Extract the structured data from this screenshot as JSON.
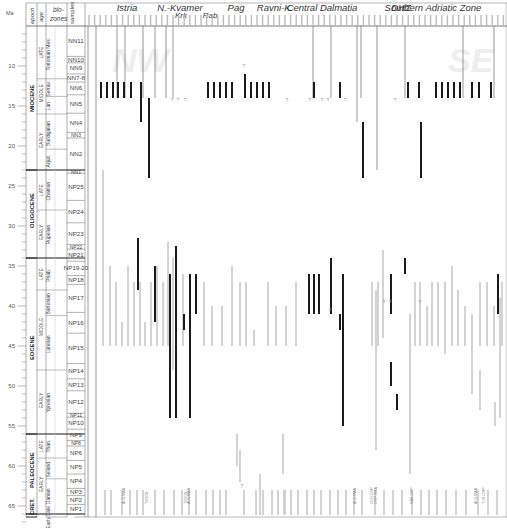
{
  "chart_data": {
    "type": "range_chart",
    "title": "",
    "ylabel": "Ma",
    "ylim": [
      5,
      68
    ],
    "y_ticks": [
      10,
      15,
      20,
      25,
      30,
      35,
      40,
      45,
      50,
      55,
      60,
      65
    ],
    "header": {
      "epoch": "epoch",
      "age": "age",
      "biozones": "bio-zones",
      "samples": "samples"
    },
    "regions": [
      {
        "name": "Istria",
        "x": 127
      },
      {
        "name": "N.-Kvamer",
        "x": 180
      },
      {
        "name": "Krk",
        "x": 181,
        "sub": true
      },
      {
        "name": "Rab",
        "x": 210,
        "sub": true
      },
      {
        "name": "Pag",
        "x": 236
      },
      {
        "name": "Ravni-K.",
        "x": 275
      },
      {
        "name": "Central Dalmatia",
        "x": 322
      },
      {
        "name": "DHZ",
        "x": 401
      },
      {
        "name": "Southern Adriatic Zone",
        "x": 433
      }
    ],
    "watermarks": [
      {
        "text": "NW",
        "x": 112,
        "y": 8
      },
      {
        "text": "SE",
        "x": 448,
        "y": 8
      }
    ],
    "epochs": [
      {
        "name": "MIOCENE",
        "from": 5,
        "to": 23
      },
      {
        "name": "OLIGOCENE",
        "from": 23,
        "to": 34
      },
      {
        "name": "EOCENE",
        "from": 34,
        "to": 56
      },
      {
        "name": "PALEOCENE",
        "from": 56,
        "to": 66
      },
      {
        "name": "CRET.",
        "from": 66,
        "to": 73
      }
    ],
    "subepochs": [
      {
        "name": "LATE",
        "from": 5,
        "to": 11.6
      },
      {
        "name": "MIDDLE",
        "from": 11.6,
        "to": 16
      },
      {
        "name": "EARLY",
        "from": 16,
        "to": 23
      },
      {
        "name": "LATE",
        "from": 23,
        "to": 28
      },
      {
        "name": "EARLY",
        "from": 28,
        "to": 34
      },
      {
        "name": "LATE",
        "from": 34,
        "to": 38
      },
      {
        "name": "MIDDLE",
        "from": 38,
        "to": 48
      },
      {
        "name": "EARLY",
        "from": 48,
        "to": 56
      },
      {
        "name": "LATE",
        "from": 56,
        "to": 59
      },
      {
        "name": "EARLY",
        "from": 59,
        "to": 66
      }
    ],
    "ages": [
      {
        "name": "Tortonian Mes.",
        "from": 5,
        "to": 11.6
      },
      {
        "name": "Serrav.",
        "from": 11.6,
        "to": 13.8
      },
      {
        "name": "Lan.",
        "from": 13.8,
        "to": 16
      },
      {
        "name": "Burdigalian",
        "from": 16,
        "to": 20.4
      },
      {
        "name": "Aquit.",
        "from": 20.4,
        "to": 23
      },
      {
        "name": "Chattian",
        "from": 23,
        "to": 28
      },
      {
        "name": "Rupelian",
        "from": 28,
        "to": 34
      },
      {
        "name": "Priab.",
        "from": 34,
        "to": 38
      },
      {
        "name": "Bartonian",
        "from": 38,
        "to": 41.2
      },
      {
        "name": "Lutetian",
        "from": 41.2,
        "to": 48
      },
      {
        "name": "Ypresian",
        "from": 48,
        "to": 56
      },
      {
        "name": "Than.",
        "from": 56,
        "to": 59
      },
      {
        "name": "Seland.",
        "from": 59,
        "to": 61.6
      },
      {
        "name": "Danian",
        "from": 61.6,
        "to": 66
      },
      {
        "name": "Early Late",
        "from": 66,
        "to": 73
      }
    ],
    "biozones": [
      {
        "name": "NN11",
        "from": 5,
        "to": 8.8
      },
      {
        "name": "NN10",
        "from": 8.8,
        "to": 9.6
      },
      {
        "name": "NN9",
        "from": 9.6,
        "to": 11
      },
      {
        "name": "NN7-8",
        "from": 11,
        "to": 12
      },
      {
        "name": "NN6",
        "from": 12,
        "to": 13.6
      },
      {
        "name": "NN5",
        "from": 13.6,
        "to": 15.9
      },
      {
        "name": "NN4",
        "from": 15.9,
        "to": 18.3
      },
      {
        "name": "NN3",
        "from": 18.3,
        "to": 19
      },
      {
        "name": "NN2",
        "from": 19,
        "to": 23
      },
      {
        "name": "NN1",
        "from": 23,
        "to": 23.4
      },
      {
        "name": "NP25",
        "from": 23.4,
        "to": 26.8
      },
      {
        "name": "NP24",
        "from": 26.8,
        "to": 29.6
      },
      {
        "name": "NP23",
        "from": 29.6,
        "to": 32.3
      },
      {
        "name": "NP22",
        "from": 32.3,
        "to": 32.9
      },
      {
        "name": "NP21",
        "from": 32.9,
        "to": 34.4
      },
      {
        "name": "NP19-20",
        "from": 34.4,
        "to": 36.2
      },
      {
        "name": "NP18",
        "from": 36.2,
        "to": 37.3
      },
      {
        "name": "NP17",
        "from": 37.3,
        "to": 40.8
      },
      {
        "name": "NP16",
        "from": 40.8,
        "to": 43.4
      },
      {
        "name": "NP15",
        "from": 43.4,
        "to": 47.2
      },
      {
        "name": "NP14",
        "from": 47.2,
        "to": 49.1
      },
      {
        "name": "NP13",
        "from": 49.1,
        "to": 50.6
      },
      {
        "name": "NP12",
        "from": 50.6,
        "to": 53.4
      },
      {
        "name": "NP11",
        "from": 53.4,
        "to": 53.9
      },
      {
        "name": "NP10",
        "from": 53.9,
        "to": 55.4
      },
      {
        "name": "NP9",
        "from": 55.4,
        "to": 56.8
      },
      {
        "name": "NP8",
        "from": 56.8,
        "to": 57.5
      },
      {
        "name": "NP6",
        "from": 57.5,
        "to": 59.3
      },
      {
        "name": "NP5",
        "from": 59.3,
        "to": 61
      },
      {
        "name": "NP4",
        "from": 61,
        "to": 62.8
      },
      {
        "name": "NP3",
        "from": 62.8,
        "to": 63.7
      },
      {
        "name": "NP2",
        "from": 63.7,
        "to": 64.8
      },
      {
        "name": "NP1",
        "from": 64.8,
        "to": 66
      }
    ],
    "annotations": [
      "?",
      "ALB-MAA",
      "TUR-CMP",
      "CEN-CMP",
      "CMP-MAA",
      "SAN-CMP"
    ],
    "legend": {
      "black": "dated Oligocene–Miocene/Eocene range (primary)",
      "grey": "reworked / secondary range"
    }
  },
  "columns_black": [
    [
      101,
      12,
      14
    ],
    [
      107,
      12,
      14
    ],
    [
      113,
      12,
      14
    ],
    [
      118,
      12,
      14
    ],
    [
      124,
      12,
      14
    ],
    [
      131,
      12,
      14
    ],
    [
      141,
      12,
      14
    ],
    [
      141,
      14,
      17
    ],
    [
      149,
      14,
      24
    ],
    [
      138,
      31.5,
      38
    ],
    [
      208,
      12,
      14
    ],
    [
      214,
      12,
      14
    ],
    [
      220,
      12,
      14
    ],
    [
      226,
      12,
      14
    ],
    [
      232,
      12,
      14
    ],
    [
      245,
      11,
      14
    ],
    [
      251,
      12,
      14
    ],
    [
      257,
      12,
      14
    ],
    [
      263,
      12,
      14
    ],
    [
      269,
      12,
      14
    ],
    [
      314,
      12,
      14
    ],
    [
      340,
      12,
      14
    ],
    [
      363,
      17,
      24
    ],
    [
      408,
      12,
      14
    ],
    [
      419,
      12,
      14
    ],
    [
      421,
      17,
      24
    ],
    [
      436,
      12,
      14
    ],
    [
      442,
      12,
      14
    ],
    [
      448,
      12,
      14
    ],
    [
      454,
      12,
      14
    ],
    [
      460,
      12,
      14
    ],
    [
      472,
      12,
      14
    ],
    [
      479,
      12,
      14
    ],
    [
      491,
      12,
      14
    ],
    [
      508,
      12,
      14
    ],
    [
      155,
      35,
      42
    ],
    [
      170,
      36,
      54
    ],
    [
      176,
      32.5,
      54
    ],
    [
      184,
      43,
      41
    ],
    [
      190,
      36,
      54
    ],
    [
      196,
      36,
      41
    ],
    [
      309,
      36,
      41
    ],
    [
      314,
      36,
      41
    ],
    [
      319,
      36,
      41
    ],
    [
      331,
      34,
      41
    ],
    [
      340,
      43,
      41
    ],
    [
      343,
      36,
      55
    ],
    [
      391,
      36,
      41
    ],
    [
      405,
      34,
      36
    ],
    [
      498,
      36,
      41
    ],
    [
      391,
      47,
      50
    ],
    [
      397,
      51,
      53
    ]
  ],
  "columns_grey": [
    [
      103,
      23,
      45
    ],
    [
      110,
      35,
      45
    ],
    [
      116,
      37,
      45
    ],
    [
      122,
      42,
      45
    ],
    [
      128,
      35,
      45
    ],
    [
      134,
      37,
      45
    ],
    [
      140,
      37,
      45
    ],
    [
      145,
      42,
      45
    ],
    [
      151,
      37,
      45
    ],
    [
      157,
      35,
      45
    ],
    [
      163,
      37,
      45
    ],
    [
      168,
      32,
      45
    ],
    [
      173,
      34,
      48
    ],
    [
      183,
      36,
      45
    ],
    [
      204,
      37,
      45
    ],
    [
      212,
      40,
      45
    ],
    [
      222,
      40,
      45
    ],
    [
      232,
      35,
      45
    ],
    [
      240,
      37,
      45
    ],
    [
      246,
      37,
      45
    ],
    [
      254,
      43,
      45
    ],
    [
      268,
      37,
      45
    ],
    [
      276,
      40,
      45
    ],
    [
      286,
      40,
      45
    ],
    [
      296,
      37,
      45
    ],
    [
      372,
      37,
      45
    ],
    [
      378,
      37,
      45
    ],
    [
      383,
      33,
      44
    ],
    [
      415,
      37,
      45
    ],
    [
      420,
      37,
      45
    ],
    [
      427,
      40,
      45
    ],
    [
      432,
      37,
      45
    ],
    [
      438,
      37,
      45
    ],
    [
      445,
      37,
      46
    ],
    [
      452,
      35,
      45
    ],
    [
      458,
      38,
      45
    ],
    [
      465,
      40,
      45
    ],
    [
      472,
      41,
      51
    ],
    [
      480,
      37,
      45
    ],
    [
      487,
      37,
      45
    ],
    [
      494,
      40,
      45
    ],
    [
      502,
      37,
      45
    ],
    [
      105,
      63,
      68
    ],
    [
      111,
      63,
      68
    ],
    [
      122,
      63,
      68
    ],
    [
      130,
      63,
      68
    ],
    [
      137,
      63,
      68
    ],
    [
      143,
      63,
      68
    ],
    [
      155,
      63,
      68
    ],
    [
      164,
      63,
      68
    ],
    [
      174,
      63,
      68
    ],
    [
      182,
      63,
      68
    ],
    [
      189,
      63,
      68
    ],
    [
      196,
      63,
      68
    ],
    [
      206,
      63,
      68
    ],
    [
      213,
      63,
      68
    ],
    [
      220,
      63,
      68
    ],
    [
      226,
      63,
      68
    ],
    [
      240,
      58,
      62
    ],
    [
      244,
      63,
      68
    ],
    [
      256,
      63,
      68
    ],
    [
      263,
      63,
      68
    ],
    [
      272,
      63,
      68
    ],
    [
      278,
      63,
      68
    ],
    [
      285,
      63,
      68
    ],
    [
      291,
      63,
      68
    ],
    [
      298,
      63,
      68
    ],
    [
      307,
      63,
      68
    ],
    [
      314,
      63,
      68
    ],
    [
      321,
      63,
      68
    ],
    [
      330,
      63,
      68
    ],
    [
      338,
      63,
      68
    ],
    [
      346,
      63,
      68
    ],
    [
      354,
      63,
      68
    ],
    [
      362,
      63,
      68
    ],
    [
      375,
      63,
      68
    ],
    [
      384,
      63,
      68
    ],
    [
      393,
      63,
      68
    ],
    [
      402,
      63,
      68
    ],
    [
      412,
      63,
      68
    ],
    [
      421,
      63,
      68
    ],
    [
      429,
      63,
      68
    ],
    [
      437,
      63,
      68
    ],
    [
      446,
      63,
      68
    ],
    [
      456,
      63,
      68
    ],
    [
      466,
      63,
      68
    ],
    [
      478,
      63,
      68
    ],
    [
      488,
      63,
      68
    ],
    [
      497,
      63,
      68
    ],
    [
      237,
      56,
      60
    ],
    [
      283,
      56,
      61
    ],
    [
      284,
      63,
      68
    ],
    [
      376,
      38,
      58
    ],
    [
      410,
      41,
      61
    ],
    [
      480,
      48,
      53
    ],
    [
      495,
      52,
      55
    ],
    [
      500,
      39,
      54
    ],
    [
      260,
      61,
      67
    ]
  ],
  "thin_lines": [
    [
      88,
      5,
      73
    ],
    [
      96,
      5,
      73
    ],
    [
      117,
      5,
      14
    ],
    [
      125,
      5,
      14
    ],
    [
      143,
      5,
      14
    ],
    [
      155,
      5,
      14
    ],
    [
      166,
      5,
      14
    ],
    [
      173,
      5,
      14
    ],
    [
      313,
      5,
      14
    ],
    [
      331,
      5,
      14
    ],
    [
      357,
      5,
      17
    ],
    [
      361,
      5,
      14
    ],
    [
      377,
      5,
      23
    ],
    [
      405,
      5,
      14
    ],
    [
      463,
      5,
      14
    ],
    [
      494,
      5,
      14
    ]
  ],
  "question_marks": [
    [
      172,
      14.3
    ],
    [
      178,
      14.3
    ],
    [
      185,
      14.3
    ],
    [
      244,
      10
    ],
    [
      287,
      14.3
    ],
    [
      310,
      14.3
    ],
    [
      322,
      14.3
    ],
    [
      328,
      14.3
    ],
    [
      345,
      14.3
    ],
    [
      395,
      14.3
    ],
    [
      330,
      40.5
    ],
    [
      384,
      39.5
    ],
    [
      390,
      39.5
    ],
    [
      420,
      39.5
    ],
    [
      242,
      62.5
    ]
  ]
}
